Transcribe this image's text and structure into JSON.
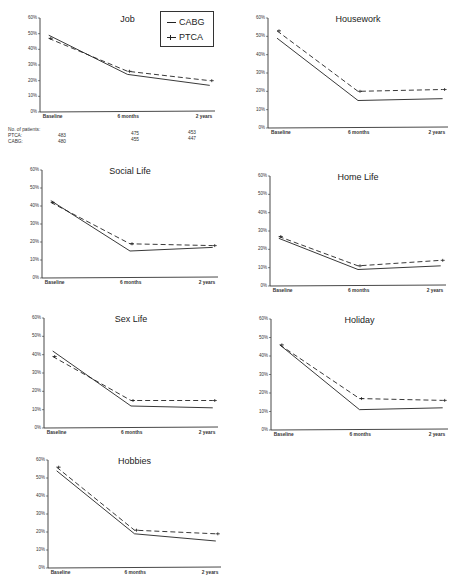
{
  "legend": {
    "entries": [
      {
        "name": "CABG",
        "style": "solid"
      },
      {
        "name": "PTCA",
        "style": "dashed"
      }
    ]
  },
  "patients": {
    "label": "No. of patients:",
    "rows": [
      {
        "label": "PTCA:",
        "values": [
          "483",
          "475",
          "453"
        ]
      },
      {
        "label": "CABG:",
        "values": [
          "480",
          "455",
          "447"
        ]
      }
    ]
  },
  "axis": {
    "yticks": [
      "60%",
      "50%",
      "40%",
      "30%",
      "20%",
      "10%",
      "0%"
    ],
    "xticks": [
      "Baseline",
      "6 months",
      "2 years"
    ]
  },
  "chart_data": [
    {
      "type": "line",
      "title": "Job",
      "categories": [
        "Baseline",
        "6 months",
        "2 years"
      ],
      "series": [
        {
          "name": "CABG",
          "values": [
            49,
            24,
            17
          ]
        },
        {
          "name": "PTCA",
          "values": [
            47,
            26,
            20
          ]
        }
      ],
      "ylim": [
        0,
        60
      ],
      "xlabel": "",
      "ylabel": "",
      "grid": false,
      "legend_position": "top-right"
    },
    {
      "type": "line",
      "title": "Housework",
      "categories": [
        "Baseline",
        "6 months",
        "2 years"
      ],
      "series": [
        {
          "name": "CABG",
          "values": [
            49,
            15,
            16
          ]
        },
        {
          "name": "PTCA",
          "values": [
            53,
            20,
            21
          ]
        }
      ],
      "ylim": [
        0,
        60
      ],
      "xlabel": "",
      "ylabel": "",
      "grid": false
    },
    {
      "type": "line",
      "title": "Social Life",
      "categories": [
        "Baseline",
        "6 months",
        "2 years"
      ],
      "series": [
        {
          "name": "CABG",
          "values": [
            43,
            15,
            17
          ]
        },
        {
          "name": "PTCA",
          "values": [
            42,
            19,
            18
          ]
        }
      ],
      "ylim": [
        0,
        60
      ],
      "xlabel": "",
      "ylabel": "",
      "grid": false
    },
    {
      "type": "line",
      "title": "Home Life",
      "categories": [
        "Baseline",
        "6 months",
        "2 years"
      ],
      "series": [
        {
          "name": "CABG",
          "values": [
            26,
            9,
            11
          ]
        },
        {
          "name": "PTCA",
          "values": [
            27,
            11,
            14
          ]
        }
      ],
      "ylim": [
        0,
        60
      ],
      "xlabel": "",
      "ylabel": "",
      "grid": false
    },
    {
      "type": "line",
      "title": "Sex Life",
      "categories": [
        "Baseline",
        "6 months",
        "2 years"
      ],
      "series": [
        {
          "name": "CABG",
          "values": [
            42,
            12,
            11
          ]
        },
        {
          "name": "PTCA",
          "values": [
            39,
            15,
            15
          ]
        }
      ],
      "ylim": [
        0,
        60
      ],
      "xlabel": "",
      "ylabel": "",
      "grid": false
    },
    {
      "type": "line",
      "title": "Holiday",
      "categories": [
        "Baseline",
        "6 months",
        "2 years"
      ],
      "series": [
        {
          "name": "CABG",
          "values": [
            46,
            11,
            12
          ]
        },
        {
          "name": "PTCA",
          "values": [
            46,
            17,
            16
          ]
        }
      ],
      "ylim": [
        0,
        60
      ],
      "xlabel": "",
      "ylabel": "",
      "grid": false
    },
    {
      "type": "line",
      "title": "Hobbies",
      "categories": [
        "Baseline",
        "6 months",
        "2 years"
      ],
      "series": [
        {
          "name": "CABG",
          "values": [
            54,
            19,
            15
          ]
        },
        {
          "name": "PTCA",
          "values": [
            56,
            21,
            19
          ]
        }
      ],
      "ylim": [
        0,
        60
      ],
      "xlabel": "",
      "ylabel": "",
      "grid": false
    }
  ]
}
